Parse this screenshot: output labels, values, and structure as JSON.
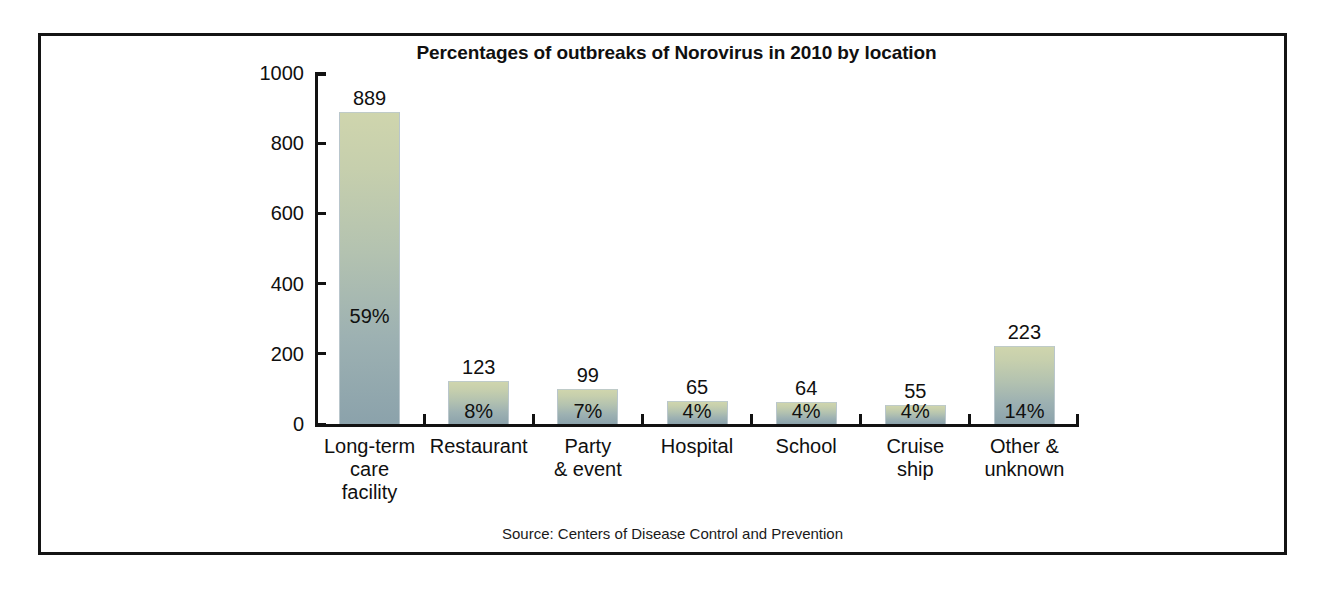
{
  "figure": {
    "title": "Percentages of outbreaks of Norovirus in 2010 by location",
    "source": "Source: Centers of Disease Control and Prevention"
  },
  "colors": {
    "bar_top": "#cfd5ad",
    "bar_bottom": "#8ba2ab",
    "axis": "#121212",
    "frame": "#141414",
    "text": "#101010",
    "background": "#ffffff"
  },
  "chart_data": {
    "type": "bar",
    "title": "Percentages of outbreaks of Norovirus in 2010 by location",
    "xlabel": "",
    "ylabel": "",
    "ylim": [
      0,
      1000
    ],
    "yticks": [
      0,
      200,
      400,
      600,
      800,
      1000
    ],
    "ytick_labels": [
      "0",
      "200",
      "400",
      "600",
      "800",
      "1000"
    ],
    "grid": false,
    "legend": false,
    "categories": [
      "Long-term care facility",
      "Restaurant",
      "Party & event",
      "Hospital",
      "School",
      "Cruise ship",
      "Other & unknown"
    ],
    "category_label_lines": [
      [
        "Long-term",
        "care",
        "facility"
      ],
      [
        "Restaurant"
      ],
      [
        "Party",
        "& event"
      ],
      [
        "Hospital"
      ],
      [
        "School"
      ],
      [
        "Cruise",
        "ship"
      ],
      [
        "Other &",
        "unknown"
      ]
    ],
    "values": [
      889,
      123,
      99,
      65,
      64,
      55,
      223
    ],
    "value_labels": [
      "889",
      "123",
      "99",
      "65",
      "64",
      "55",
      "223"
    ],
    "percent_labels": [
      "59%",
      "8%",
      "7%",
      "4%",
      "4%",
      "4%",
      "14%"
    ],
    "percentages": [
      59,
      8,
      7,
      4,
      4,
      4,
      14
    ],
    "source": "Source: Centers of Disease Control and Prevention"
  }
}
